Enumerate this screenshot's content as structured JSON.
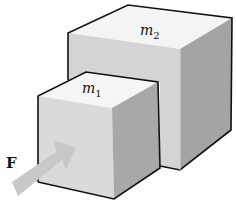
{
  "diagram": {
    "blocks": [
      {
        "id": "m1",
        "label": "m",
        "subscript": "1",
        "description": "smaller block, in front, pushed by force"
      },
      {
        "id": "m2",
        "label": "m",
        "subscript": "2",
        "description": "larger block, behind m1"
      }
    ],
    "force": {
      "label": "F",
      "direction": "pushing m1 toward m2"
    },
    "colors": {
      "top_face": "#f4f4f4",
      "front_face": "#d9d9d9",
      "side_face": "#a8a8a8",
      "edge": "#111111",
      "arrow": "#c8c8c8"
    }
  }
}
